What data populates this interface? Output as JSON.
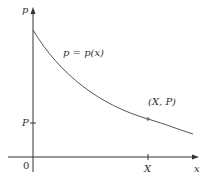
{
  "diagram": {
    "y_axis_label": "p",
    "x_axis_label": "x",
    "origin_label": "0",
    "curve_label": "p = p(x)",
    "point_label": "(X, P)",
    "x_tick_label": "X",
    "y_tick_label": "P",
    "colors": {
      "axis": "#333333",
      "curve": "#555555",
      "point": "#777777"
    }
  }
}
